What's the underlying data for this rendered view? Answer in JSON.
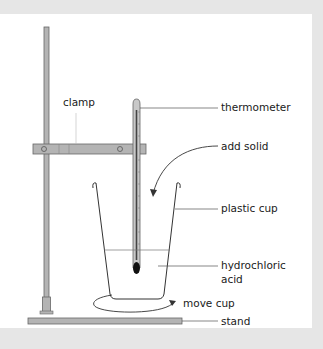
{
  "diagram": {
    "type": "apparatus",
    "labels": {
      "clamp": "clamp",
      "thermometer": "thermometer",
      "add_solid": "add solid",
      "plastic_cup": "plastic cup",
      "hydrochloric_acid_line1": "hydrochloric",
      "hydrochloric_acid_line2": "acid",
      "move_cup": "move cup",
      "stand": "stand"
    },
    "colors": {
      "background": "#e6e6e6",
      "panel": "#ffffff",
      "stand_fill": "#b4b4b4",
      "stroke": "#555555",
      "line": "#333333",
      "bulb": "#111111"
    }
  }
}
